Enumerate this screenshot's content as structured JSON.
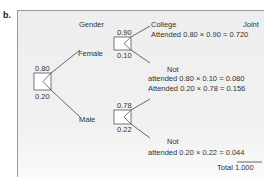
{
  "figure_label": "b.",
  "headers": {
    "gender": "Gender",
    "college": "College",
    "joint": "Joint"
  },
  "root": {
    "p_female": "0.80",
    "p_male": "0.20"
  },
  "branches": {
    "female": {
      "label": "Female",
      "p_attended": "0.90",
      "p_not": "0.10"
    },
    "male": {
      "label": "Male",
      "p_attended": "0.78",
      "p_not": "0.22"
    }
  },
  "outcomes": [
    {
      "label": "Attended",
      "calc": "0.80 × 0.90",
      "eq": "=",
      "joint": "0.720"
    },
    {
      "label_top": "Not",
      "label": "attended",
      "calc": "0.80 × 0.10",
      "eq": "=",
      "joint": "0.080"
    },
    {
      "label": "Attended",
      "calc": "0.20 × 0.78",
      "eq": "=",
      "joint": "0.156"
    },
    {
      "label_top": "Not",
      "label": "attended",
      "calc": "0.20 × 0.22",
      "eq": "=",
      "joint": "0.044"
    }
  ],
  "total": {
    "label": "Total",
    "value": "1.000"
  }
}
